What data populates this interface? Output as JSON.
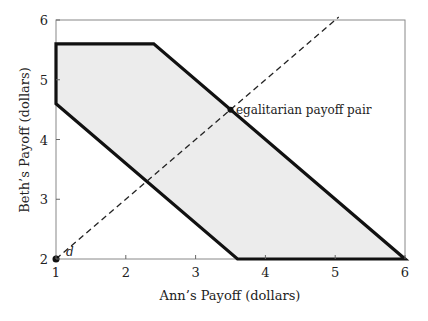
{
  "chart_data": {
    "type": "area",
    "title": "",
    "xlabel": "Ann’s Payoff (dollars)",
    "ylabel": "Beth’s Payoff (dollars)",
    "xlim": [
      1,
      6
    ],
    "ylim": [
      2,
      6
    ],
    "grid": false,
    "xticks": [
      1,
      2,
      3,
      4,
      5,
      6
    ],
    "yticks": [
      2,
      3,
      4,
      5,
      6
    ],
    "xtick_labels": [
      "1",
      "2",
      "3",
      "4",
      "5",
      "6"
    ],
    "ytick_labels": [
      "2",
      "3",
      "4",
      "5",
      "6"
    ],
    "feasible_region": {
      "vertices": [
        [
          1,
          5.6
        ],
        [
          2.4,
          5.6
        ],
        [
          6,
          2
        ],
        [
          3.6,
          2
        ],
        [
          1,
          4.6
        ]
      ],
      "fill": "#ececec",
      "stroke": "#111111"
    },
    "egalitarian_line": {
      "style": "dashed",
      "from": [
        1,
        2
      ],
      "to": [
        5.05,
        6.05
      ],
      "slope": 1
    },
    "points": [
      {
        "label": "d",
        "x": 1,
        "y": 2
      },
      {
        "label": "egalitarian payoff pair",
        "x": 3.5,
        "y": 4.5
      }
    ],
    "annotations": [
      "d",
      "egalitarian payoff pair"
    ]
  }
}
